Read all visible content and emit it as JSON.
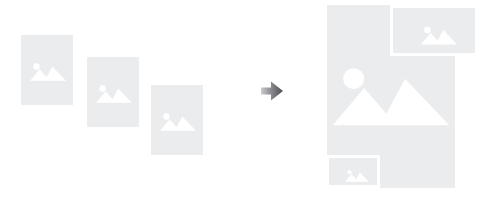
{
  "illustration": {
    "title": "Combine images into a collage",
    "alt": "Three separate image placeholders on the left, an arrow pointing right, and a merged collage layout on the right",
    "canvas": {
      "width": 490,
      "height": 199,
      "background": "#ffffff"
    },
    "colors": {
      "card_fill": "#ebecee",
      "glyph_fill": "#ffffff",
      "card_border": "#ffffff",
      "arrow_dark": "#58595b",
      "arrow_light": "#bcbec0",
      "page_background": "#ffffff"
    },
    "source": {
      "label": "Separate images",
      "cards": [
        {
          "name": "source-image-1",
          "label": "Image 1",
          "x": 21,
          "y": 35,
          "width": 52,
          "height": 70,
          "glyph": "image-placeholder-icon"
        },
        {
          "name": "source-image-2",
          "label": "Image 2",
          "x": 87,
          "y": 57,
          "width": 52,
          "height": 70,
          "glyph": "image-placeholder-icon"
        },
        {
          "name": "source-image-3",
          "label": "Image 3",
          "x": 151,
          "y": 85,
          "width": 52,
          "height": 70,
          "glyph": "image-placeholder-icon"
        }
      ]
    },
    "arrow": {
      "name": "arrow-right-icon",
      "label": "converts to",
      "x": 259,
      "y": 78,
      "size": 26,
      "direction": "right"
    },
    "result": {
      "label": "Collage",
      "cards": [
        {
          "name": "collage-main-card",
          "label": "Main image",
          "x": 327,
          "y": 5,
          "width": 128,
          "height": 183,
          "glyph": "image-placeholder-icon"
        },
        {
          "name": "collage-top-right-card",
          "label": "Top right image",
          "x": 390,
          "y": 5,
          "width": 88,
          "height": 51,
          "glyph": "image-placeholder-icon"
        },
        {
          "name": "collage-bottom-left-card",
          "label": "Bottom left image",
          "x": 326,
          "y": 155,
          "width": 54,
          "height": 33,
          "glyph": "image-placeholder-icon"
        }
      ]
    }
  }
}
